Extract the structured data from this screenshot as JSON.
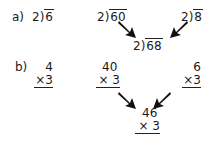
{
  "part_a": {
    "label": "a)",
    "problems": [
      {
        "divisor": "2",
        "dividend": "6"
      },
      {
        "divisor": "2",
        "dividend": "60"
      },
      {
        "divisor": "2",
        "dividend": "8"
      },
      {
        "divisor": "2",
        "dividend": "68"
      }
    ]
  },
  "part_b": {
    "label": "b)",
    "problems": [
      {
        "top": "4",
        "bottom": "×3"
      },
      {
        "top": "40",
        "bottom": "× 3"
      },
      {
        "top": "6",
        "bottom": "×3"
      },
      {
        "top": "46",
        "bottom": "× 3"
      }
    ]
  },
  "bracket_symbol": ")",
  "arrow_color": "#111111"
}
